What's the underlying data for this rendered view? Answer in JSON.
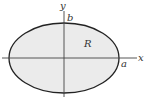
{
  "diagram": {
    "type": "ellipse-region",
    "labels": {
      "x_axis": "x",
      "y_axis": "y",
      "semi_major": "a",
      "semi_minor": "b",
      "region": "R"
    },
    "colors": {
      "fill": "#ebebeb",
      "stroke": "#222222",
      "axis": "#444444"
    }
  }
}
